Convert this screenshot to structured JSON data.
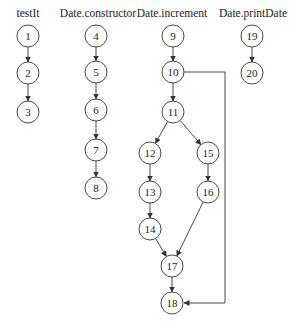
{
  "diagram": {
    "type": "control-flow-graphs",
    "columns": [
      {
        "id": "testIt",
        "label": "testIt",
        "x": 28
      },
      {
        "id": "constructor",
        "label": "Date.constructor",
        "x": 98
      },
      {
        "id": "increment",
        "label": "Date.increment",
        "x": 172
      },
      {
        "id": "printDate",
        "label": "Date.printDate",
        "x": 253
      }
    ],
    "label_y": 17,
    "node_radius": 11,
    "nodes": [
      {
        "id": "1",
        "label": "1",
        "x": 28,
        "y": 36
      },
      {
        "id": "2",
        "label": "2",
        "x": 28,
        "y": 73
      },
      {
        "id": "3",
        "label": "3",
        "x": 28,
        "y": 112
      },
      {
        "id": "4",
        "label": "4",
        "x": 96,
        "y": 36
      },
      {
        "id": "5",
        "label": "5",
        "x": 96,
        "y": 72
      },
      {
        "id": "6",
        "label": "6",
        "x": 96,
        "y": 110
      },
      {
        "id": "7",
        "label": "7",
        "x": 96,
        "y": 150
      },
      {
        "id": "8",
        "label": "8",
        "x": 96,
        "y": 188
      },
      {
        "id": "9",
        "label": "9",
        "x": 173,
        "y": 36
      },
      {
        "id": "10",
        "label": "10",
        "x": 173,
        "y": 72
      },
      {
        "id": "11",
        "label": "11",
        "x": 173,
        "y": 112
      },
      {
        "id": "12",
        "label": "12",
        "x": 150,
        "y": 153
      },
      {
        "id": "13",
        "label": "13",
        "x": 150,
        "y": 192
      },
      {
        "id": "14",
        "label": "14",
        "x": 150,
        "y": 229
      },
      {
        "id": "15",
        "label": "15",
        "x": 208,
        "y": 153
      },
      {
        "id": "16",
        "label": "16",
        "x": 208,
        "y": 192
      },
      {
        "id": "17",
        "label": "17",
        "x": 172,
        "y": 266
      },
      {
        "id": "18",
        "label": "18",
        "x": 172,
        "y": 303
      },
      {
        "id": "19",
        "label": "19",
        "x": 252,
        "y": 36
      },
      {
        "id": "20",
        "label": "20",
        "x": 252,
        "y": 73
      }
    ],
    "edges": [
      {
        "from": "1",
        "to": "2"
      },
      {
        "from": "2",
        "to": "3"
      },
      {
        "from": "4",
        "to": "5"
      },
      {
        "from": "5",
        "to": "6"
      },
      {
        "from": "6",
        "to": "7"
      },
      {
        "from": "7",
        "to": "8"
      },
      {
        "from": "9",
        "to": "10"
      },
      {
        "from": "10",
        "to": "11"
      },
      {
        "from": "11",
        "to": "12"
      },
      {
        "from": "11",
        "to": "15"
      },
      {
        "from": "12",
        "to": "13"
      },
      {
        "from": "13",
        "to": "14"
      },
      {
        "from": "14",
        "to": "17"
      },
      {
        "from": "15",
        "to": "16"
      },
      {
        "from": "16",
        "to": "17"
      },
      {
        "from": "17",
        "to": "18"
      },
      {
        "from": "10",
        "to": "18",
        "route": [
          [
            184,
            72
          ],
          [
            225,
            72
          ],
          [
            225,
            303
          ],
          [
            184,
            303
          ]
        ]
      },
      {
        "from": "19",
        "to": "20"
      }
    ],
    "colors": {
      "stroke": "#333333",
      "text": "#222222",
      "background": "#ffffff"
    }
  }
}
